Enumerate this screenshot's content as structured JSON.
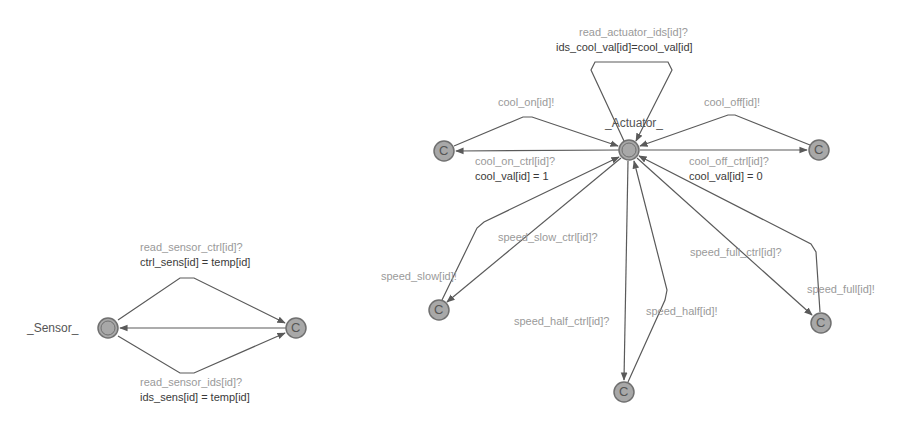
{
  "colors": {
    "edge": "#5a5a5a",
    "node_fill": "#a8a8a8",
    "node_stroke": "#707070",
    "sync_label": "#9a9a9a",
    "update_label": "#3a3a3a"
  },
  "sensor": {
    "name": "_Sensor_",
    "locations": [
      {
        "id": "sensor-initial",
        "label": "",
        "type": "initial"
      },
      {
        "id": "sensor-committed",
        "label": "C",
        "type": "committed"
      }
    ],
    "edges": [
      {
        "sync": "read_sensor_ctrl[id]?",
        "update": "ctrl_sens[id] = temp[id]"
      },
      {
        "sync": "read_sensor_ids[id]?",
        "update": "ids_sens[id] = temp[id]"
      },
      {
        "sync": "",
        "update": ""
      }
    ]
  },
  "actuator": {
    "name": "_Actuator_",
    "self_loop": {
      "sync": "read_actuator_ids[id]?",
      "update": "ids_cool_val[id]=cool_val[id]"
    },
    "cool_on": {
      "sync_out": "cool_on_ctrl[id]?",
      "update_out": "cool_val[id] = 1",
      "sync_back": "cool_on[id]!"
    },
    "cool_off": {
      "sync_out": "cool_off_ctrl[id]?",
      "update_out": "cool_val[id] = 0",
      "sync_back": "cool_off[id]!"
    },
    "speed_slow": {
      "sync_out": "speed_slow_ctrl[id]?",
      "sync_back": "speed_slow[id]!"
    },
    "speed_half": {
      "sync_out": "speed_half_ctrl[id]?",
      "sync_back": "speed_half[id]!"
    },
    "speed_full": {
      "sync_out": "speed_full_ctrl[id]?",
      "sync_back": "speed_full[id]!"
    },
    "committed_label": "C"
  }
}
